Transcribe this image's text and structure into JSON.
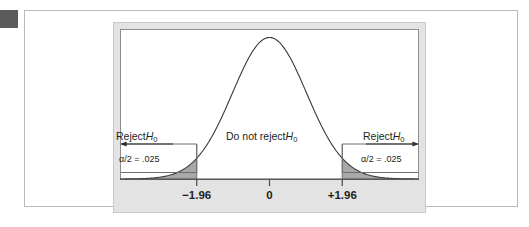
{
  "figure": {
    "corner_marker": "corner-marker-square"
  },
  "labels": {
    "reject_left": "Reject",
    "reject_left_symbol": "H",
    "reject_left_subscript": "0",
    "reject_right": "Reject",
    "reject_right_symbol": "H",
    "reject_right_subscript": "0",
    "do_not_reject": "Do not reject",
    "do_not_reject_symbol": "H",
    "do_not_reject_subscript": "0",
    "alpha_left": "α/2 = .025",
    "alpha_right": "α/2 = .025"
  },
  "axis": {
    "tick_labels": [
      "−1.96",
      "0",
      "+1.96"
    ],
    "tick_values": [
      -1.96,
      0,
      1.96
    ]
  },
  "colors": {
    "background": "#ffffff",
    "panel_gray": "#e3e3e3",
    "plot_white": "#ffffff",
    "curve_stroke": "#3a3a3a",
    "tail_fill": "#a8a8a8",
    "axis_line": "#4a4a4a",
    "box_stroke": "#6e6e6e",
    "text": "#231f20",
    "corner_marker": "#5b5b5b",
    "outer_border": "#b9b9bb"
  },
  "chart_data": {
    "type": "line",
    "xlabel": "",
    "ylabel": "",
    "xlim": [
      -4.0,
      4.0
    ],
    "ylim": [
      0,
      0.42
    ],
    "grid": false,
    "legend": "none",
    "distribution": {
      "name": "standard normal",
      "mean": 0,
      "sd": 1,
      "formula": "phi(z) = (1/sqrt(2*pi)) * exp(-z^2/2)"
    },
    "critical_values": [
      -1.96,
      1.96
    ],
    "tail_areas": [
      0.025,
      0.025
    ],
    "significance_level": 0.05,
    "regions": [
      {
        "name": "Reject H0 (lower tail)",
        "from": -4.0,
        "to": -1.96,
        "area": 0.025,
        "shaded": true
      },
      {
        "name": "Do not reject H0",
        "from": -1.96,
        "to": 1.96,
        "area": 0.95,
        "shaded": false
      },
      {
        "name": "Reject H0 (upper tail)",
        "from": 1.96,
        "to": 4.0,
        "area": 0.025,
        "shaded": true
      }
    ],
    "x": [
      -4.0,
      -3.5,
      -3.0,
      -2.5,
      -1.96,
      -1.5,
      -1.0,
      -0.5,
      0.0,
      0.5,
      1.0,
      1.5,
      1.96,
      2.5,
      3.0,
      3.5,
      4.0
    ],
    "values": [
      0.0001,
      0.0009,
      0.0044,
      0.0175,
      0.0584,
      0.1295,
      0.242,
      0.3521,
      0.3989,
      0.3521,
      0.242,
      0.1295,
      0.0584,
      0.0175,
      0.0044,
      0.0009,
      0.0001
    ],
    "annotations": [
      {
        "text": "Reject H0",
        "x": -2.6,
        "y": 0.2
      },
      {
        "text": "α/2 = .025",
        "x": -2.6,
        "y": 0.12
      },
      {
        "text": "Do not reject H0",
        "x": 0.0,
        "y": 0.2
      },
      {
        "text": "Reject H0",
        "x": 2.6,
        "y": 0.2
      },
      {
        "text": "α/2 = .025",
        "x": 2.6,
        "y": 0.12
      }
    ]
  }
}
